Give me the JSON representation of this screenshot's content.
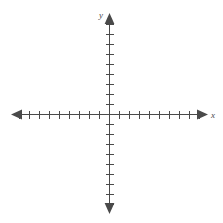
{
  "figure": {
    "title": "",
    "background_color": "#ffffff",
    "stroke_color": "#4a4a4a",
    "width": 223,
    "height": 223
  },
  "axes": {
    "x_axis": {
      "label": "x",
      "label_name": "x-axis-label",
      "start_px": 12,
      "end_px": 207,
      "y_px": 114,
      "arrow_start": true,
      "arrow_end": true,
      "tick_spacing_px": 10,
      "ticks_negative": 9,
      "ticks_positive": 9,
      "tick_half_length_px": 4
    },
    "y_axis": {
      "label": "y",
      "label_name": "y-axis-label",
      "start_px": 14,
      "end_px": 213,
      "x_px": 109,
      "arrow_start": true,
      "arrow_end": true,
      "tick_spacing_px": 10,
      "ticks_positive": 9,
      "ticks_negative": 9,
      "tick_half_length_px": 4
    },
    "origin": {
      "x_px": 109,
      "y_px": 114
    }
  },
  "chart_data": {
    "type": "line",
    "title": "",
    "subtitle": "",
    "xlabel": "x",
    "ylabel": "y",
    "xlim": [
      -9,
      9
    ],
    "ylim": [
      -9,
      9
    ],
    "x_tick_values": [
      -9,
      -8,
      -7,
      -6,
      -5,
      -4,
      -3,
      -2,
      -1,
      1,
      2,
      3,
      4,
      5,
      6,
      7,
      8,
      9
    ],
    "y_tick_values": [
      -9,
      -8,
      -7,
      -6,
      -5,
      -4,
      -3,
      -2,
      -1,
      1,
      2,
      3,
      4,
      5,
      6,
      7,
      8,
      9
    ],
    "x_tick_labels": [],
    "y_tick_labels": [],
    "grid": false,
    "legend": null,
    "legend_position": "none",
    "series": [],
    "annotations": []
  }
}
